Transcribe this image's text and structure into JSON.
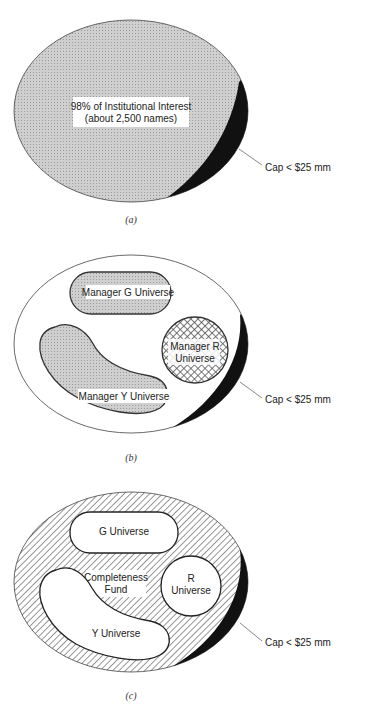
{
  "figure": {
    "panels": [
      {
        "id": "a",
        "caption": "(a)",
        "main_label_line1": "98% of Institutional Interest",
        "main_label_line2": "(about 2,500 names)",
        "cap_label": "Cap < $25 mm"
      },
      {
        "id": "b",
        "caption": "(b)",
        "universes": [
          {
            "name": "Manager G Universe"
          },
          {
            "name_line1": "Manager R",
            "name_line2": "Universe"
          },
          {
            "name": "Manager Y Universe"
          }
        ],
        "cap_label": "Cap < $25 mm"
      },
      {
        "id": "c",
        "caption": "(c)",
        "universes": [
          {
            "name": "G Universe"
          },
          {
            "name_line1": "R",
            "name_line2": "Universe"
          },
          {
            "name": "Y Universe"
          }
        ],
        "completeness_line1": "Completeness",
        "completeness_line2": "Fund",
        "cap_label": "Cap < $25 mm"
      }
    ]
  },
  "colors": {
    "gray_fill": "#c8c8c8",
    "black": "#111111",
    "outline": "#333333"
  }
}
